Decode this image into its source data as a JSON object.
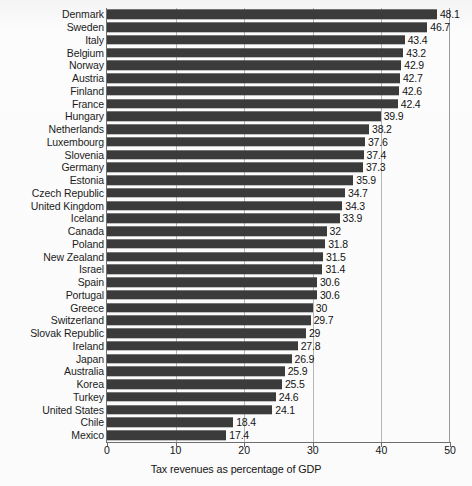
{
  "chart_data": {
    "type": "bar",
    "orientation": "horizontal",
    "title": "",
    "xlabel": "Tax revenues as percentage of GDP",
    "ylabel": "",
    "xlim": [
      0,
      50
    ],
    "xticks": [
      0,
      10,
      20,
      30,
      40,
      50
    ],
    "grid": true,
    "legend": false,
    "bar_color": "#3b3b3b",
    "background_color": "#fbfbfb",
    "categories": [
      "Denmark",
      "Sweden",
      "Italy",
      "Belgium",
      "Norway",
      "Austria",
      "Finland",
      "France",
      "Hungary",
      "Netherlands",
      "Luxembourg",
      "Slovenia",
      "Germany",
      "Estonia",
      "Czech Republic",
      "United Kingdom",
      "Iceland",
      "Canada",
      "Poland",
      "New Zealand",
      "Israel",
      "Spain",
      "Portugal",
      "Greece",
      "Switzerland",
      "Slovak Republic",
      "Ireland",
      "Japan",
      "Australia",
      "Korea",
      "Turkey",
      "United States",
      "Chile",
      "Mexico"
    ],
    "values": [
      48.1,
      46.7,
      43.4,
      43.2,
      42.9,
      42.7,
      42.6,
      42.4,
      39.9,
      38.2,
      37.6,
      37.4,
      37.3,
      35.9,
      34.7,
      34.3,
      33.9,
      32,
      31.8,
      31.5,
      31.4,
      30.6,
      30.6,
      30,
      29.7,
      29,
      27.8,
      26.9,
      25.9,
      25.5,
      24.6,
      24.1,
      18.4,
      17.4
    ],
    "value_labels": [
      "48.1",
      "46.7",
      "43.4",
      "43.2",
      "42.9",
      "42.7",
      "42.6",
      "42.4",
      "39.9",
      "38.2",
      "37.6",
      "37.4",
      "37.3",
      "35.9",
      "34.7",
      "34.3",
      "33.9",
      "32",
      "31.8",
      "31.5",
      "31.4",
      "30.6",
      "30.6",
      "30",
      "29.7",
      "29",
      "27.8",
      "26.9",
      "25.9",
      "25.5",
      "24.6",
      "24.1",
      "18.4",
      "17.4"
    ],
    "tick_labels": [
      "0",
      "10",
      "20",
      "30",
      "40",
      "50"
    ]
  }
}
